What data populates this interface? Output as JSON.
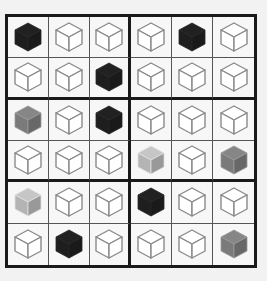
{
  "puzzle": {
    "rows": 6,
    "cols": 6,
    "block": {
      "rows": 2,
      "cols": 3
    },
    "legend": {
      "B": "black-cube",
      "G": "gray-cube",
      "L": "light-gray-cube",
      "W": "white-cube"
    },
    "colors": {
      "B": "#1e1e1e",
      "G": "#7a7a7a",
      "L": "#b4b4b4",
      "W": "#ffffff",
      "edge": "#8a8a8a"
    },
    "cells": [
      [
        "B",
        "W",
        "W",
        "W",
        "B",
        "W"
      ],
      [
        "W",
        "W",
        "B",
        "W",
        "W",
        "W"
      ],
      [
        "G",
        "W",
        "B",
        "W",
        "W",
        "W"
      ],
      [
        "W",
        "W",
        "W",
        "L",
        "W",
        "G"
      ],
      [
        "L",
        "W",
        "W",
        "B",
        "W",
        "W"
      ],
      [
        "W",
        "B",
        "W",
        "W",
        "W",
        "G"
      ]
    ]
  }
}
